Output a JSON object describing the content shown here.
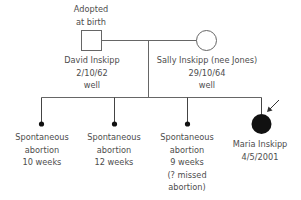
{
  "pedigree": {
    "father": {
      "note_line1": "Adopted",
      "note_line2": "at birth",
      "name": "David Inskipp",
      "dob": "2/10/62",
      "status": "well",
      "symbol": "square-unaffected"
    },
    "mother": {
      "name": "Sally Inskipp (nee Jones)",
      "dob": "29/10/64",
      "status": "well",
      "symbol": "circle-unaffected"
    },
    "children": [
      {
        "line1": "Spontaneous",
        "line2": "abortion",
        "line3": "10 weeks",
        "symbol": "small-filled-dot"
      },
      {
        "line1": "Spontaneous",
        "line2": "abortion",
        "line3": "12 weeks",
        "symbol": "small-filled-dot"
      },
      {
        "line1": "Spontaneous",
        "line2": "abortion",
        "line3": "9 weeks",
        "line4": "(? missed",
        "line5": "abortion)",
        "symbol": "small-filled-dot"
      },
      {
        "name": "Maria Inskipp",
        "dob": "4/5/2001",
        "symbol": "circle-affected",
        "proband": true
      }
    ],
    "colors": {
      "line": "#666666",
      "fill": "#111111"
    }
  }
}
